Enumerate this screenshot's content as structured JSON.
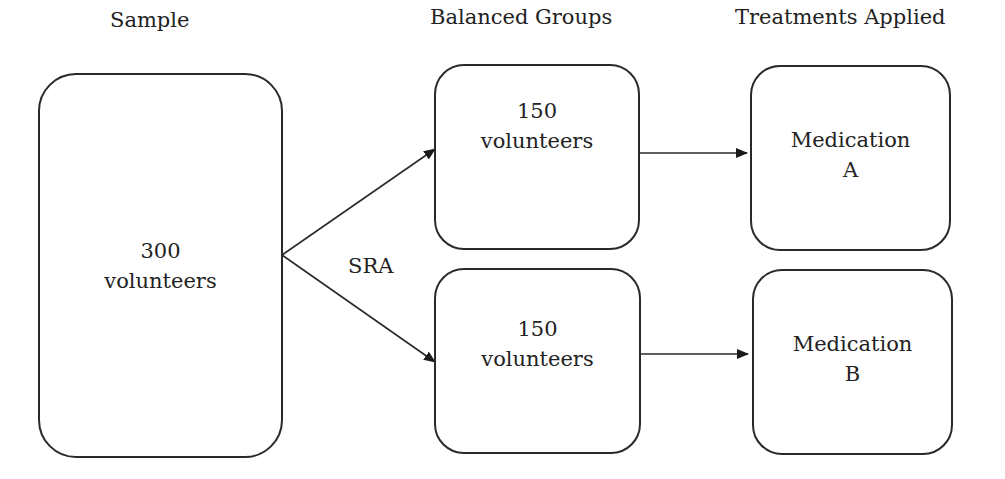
{
  "headers": {
    "sample": "Sample",
    "groups": "Balanced Groups",
    "treatments": "Treatments Applied"
  },
  "nodes": {
    "sample": {
      "line1": "300",
      "line2": "volunteers"
    },
    "group_a": {
      "line1": "150",
      "line2": "volunteers"
    },
    "group_b": {
      "line1": "150",
      "line2": "volunteers"
    },
    "medication_a": {
      "line1": "Medication",
      "line2": "A"
    },
    "medication_b": {
      "line1": "Medication",
      "line2": "B"
    }
  },
  "edges": {
    "split_label": "SRA"
  },
  "colors": {
    "stroke": "#2a2a2a",
    "text": "#222222",
    "background": "#ffffff"
  }
}
